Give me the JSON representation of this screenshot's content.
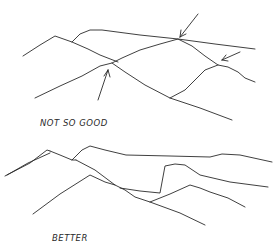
{
  "sketches": [
    {
      "id": "top",
      "label": "NOT SO GOOD",
      "lines": [
        "M23,56 L40,45 L55,36 L72,42 L88,49 L100,55 L118,62",
        "M72,42 L80,34 L90,30 L102,30 L140,35 L178,39 L215,44 L255,49",
        "M35,98 L60,86 L82,76 L100,66 L112,63 L122,58 L140,50 L160,44 L178,39 L192,46 L205,56 L218,65 L228,67 L238,72 L245,78 L255,82",
        "M112,63 L125,72 L145,85 L170,98 L200,108 L232,120",
        "M170,98 L185,90 L195,80 L205,70 L218,65"
      ],
      "arrows": [
        {
          "path": "M198,14 L180,37",
          "head": "M180,37 L181,30 M180,37 L186,34"
        },
        {
          "path": "M240,52 L222,60",
          "head": "M222,60 L226,55 M222,60 L228,61"
        },
        {
          "path": "M98,100 L108,70",
          "head": "M108,70 L104,76 M108,70 L110,77"
        }
      ]
    },
    {
      "id": "bottom",
      "label": "BETTER",
      "lines": [
        "M5,176 L30,163 L47,150 L50,151",
        "M7,175 L28,163 L50,153",
        "M50,151 L60,155 L72,160 L76,160",
        "M72,160 L82,150 L90,146 L105,150 L126,155 L170,156 L210,157 L222,154 L240,155 L272,162",
        "M76,160 L95,170 L115,185 L125,190 L135,197 L150,202 L180,213 L205,225",
        "M33,214 L60,194 L90,175 L105,182 L115,185",
        "M120,188 L140,191 L160,193 L165,166 L175,164 L185,165 L200,175 L230,182 L268,187",
        "M150,202 L170,194 L190,185 L200,188 L210,192 L228,198 L245,207"
      ]
    }
  ],
  "colors": {
    "ink": "#2a2a2a",
    "paper": "#ffffff"
  }
}
